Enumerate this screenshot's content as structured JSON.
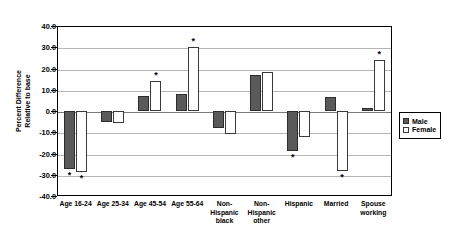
{
  "chart_data": {
    "type": "bar",
    "title": "",
    "xlabel": "",
    "ylabel": "Percent Difference Relative to base",
    "ylabel_lines": [
      "Percent Difference",
      "Relative to base"
    ],
    "ylim": [
      -40.0,
      40.0
    ],
    "ytick_step": 10.0,
    "yticks": [
      "40.0",
      "30.0",
      "20.0",
      "10.0",
      "0.0",
      "-10.0",
      "-20.0",
      "-30.0",
      "-40.0"
    ],
    "ytick_values": [
      40.0,
      30.0,
      20.0,
      10.0,
      0.0,
      -10.0,
      -20.0,
      -30.0,
      -40.0
    ],
    "grid": true,
    "legend_position": "right",
    "significance_marker": "*",
    "categories": [
      "Age 16-24",
      "Age 25-34",
      "Age 45-54",
      "Age 55-64",
      "Non-Hispanic black",
      "Non-Hispanic other",
      "Hispanic",
      "Married",
      "Spouse working"
    ],
    "category_lines": [
      [
        "Age 16-24"
      ],
      [
        "Age 25-34"
      ],
      [
        "Age 45-54"
      ],
      [
        "Age 55-64"
      ],
      [
        "Non-",
        "Hispanic",
        "black"
      ],
      [
        "Non-",
        "Hispanic",
        "other"
      ],
      [
        "Hispanic"
      ],
      [
        "Married"
      ],
      [
        "Spouse",
        "working"
      ]
    ],
    "series": [
      {
        "name": "Male",
        "color": "#5a5a5a",
        "values": [
          -27.5,
          -5.0,
          7.0,
          8.0,
          -8.0,
          17.0,
          -19.0,
          6.5,
          1.5
        ],
        "significant": [
          true,
          false,
          false,
          false,
          false,
          false,
          true,
          false,
          false
        ]
      },
      {
        "name": "Female",
        "color": "#ffffff",
        "values": [
          -28.5,
          -5.5,
          14.0,
          30.0,
          -11.0,
          18.5,
          -12.0,
          -28.0,
          24.0
        ],
        "significant": [
          true,
          false,
          true,
          true,
          false,
          false,
          false,
          true,
          true
        ]
      }
    ]
  }
}
